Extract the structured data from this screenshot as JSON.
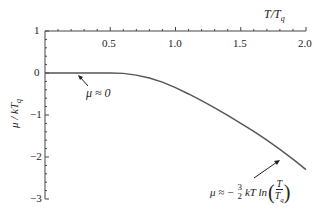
{
  "chart_data": {
    "type": "line",
    "title": "",
    "xlabel": "T/T_q",
    "ylabel": "μ / kT_q",
    "xlim": [
      0,
      2.0
    ],
    "ylim": [
      -3,
      1
    ],
    "x_ticks": [
      "0.5",
      "1.0",
      "1.5",
      "2.0"
    ],
    "y_ticks": [
      "1",
      "0",
      "−1",
      "−2",
      "−3"
    ],
    "grid": false,
    "series": [
      {
        "name": "μ / kT_q",
        "x": [
          0.0,
          0.25,
          0.5,
          0.6,
          0.7,
          0.8,
          0.9,
          1.0,
          1.1,
          1.2,
          1.3,
          1.4,
          1.5,
          1.6,
          1.7,
          1.8,
          1.9,
          2.0
        ],
        "y": [
          0.0,
          0.0,
          0.0,
          -0.01,
          -0.05,
          -0.12,
          -0.22,
          -0.35,
          -0.5,
          -0.66,
          -0.83,
          -1.01,
          -1.2,
          -1.39,
          -1.6,
          -1.82,
          -2.05,
          -2.3
        ]
      }
    ],
    "annotations": [
      {
        "text": "μ ≈ 0",
        "points_to": [
          0.5,
          0.0
        ]
      },
      {
        "text": "μ ≈ − 3/2 kT ln(T/T_q)",
        "points_to": [
          1.85,
          -1.95
        ]
      }
    ]
  },
  "labels": {
    "x_axis": "T/T",
    "x_axis_sub": "q",
    "y_axis": "μ / kT",
    "y_axis_sub": "q",
    "x_ticks": [
      "0.5",
      "1.0",
      "1.5",
      "2.0"
    ],
    "y_ticks": [
      "1",
      "0",
      "−1",
      "−2",
      "−3"
    ],
    "ann1": "μ ≈ 0",
    "ann2_prefix": "μ ≈ −",
    "ann2_num": "3",
    "ann2_den": "2",
    "ann2_mid": "kT ln",
    "ann2_fnum": "T",
    "ann2_fden": "T",
    "ann2_fden_sub": "q"
  }
}
